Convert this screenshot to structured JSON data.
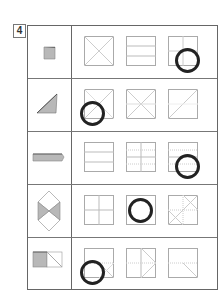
{
  "question": {
    "number": "4"
  },
  "colors": {
    "border": "#666666",
    "fold_line": "#bbbbbb",
    "shape_fill": "#b8b8b8",
    "circle": "#222222"
  },
  "rows": [
    {
      "shape": "folded-square-small",
      "options": [
        "diagonal-x",
        "two-horizontal-lines",
        "cross-quarters"
      ],
      "selected_index": 2
    },
    {
      "shape": "folded-triangle",
      "options": [
        "x-with-diagonal",
        "x-with-cross",
        "single-diagonal-with-x-faint"
      ],
      "selected_index": 0
    },
    {
      "shape": "folded-strip",
      "options": [
        "two-horizontal-lines",
        "grid-vertical-horizontal-dotted",
        "horizontal-dotted-lines"
      ],
      "selected_index": 2
    },
    {
      "shape": "folded-diamond-pair",
      "options": [
        "cross-quarters",
        "blank-square",
        "cross-with-diagonals-corners"
      ],
      "selected_index": 1
    },
    {
      "shape": "folded-half-with-triangle",
      "options": [
        "horizontal-mid-with-diagonal",
        "vertical-with-chevron",
        "horizontal-with-diagonal"
      ],
      "selected_index": 0
    }
  ]
}
